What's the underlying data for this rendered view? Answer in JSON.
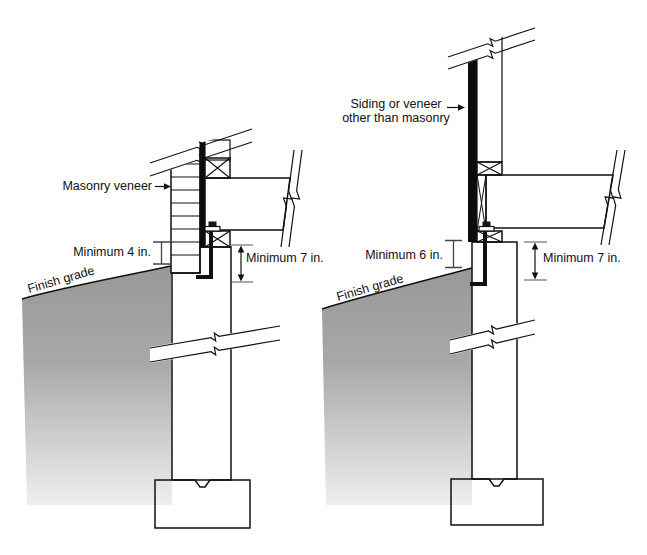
{
  "figure": {
    "title_hint": "Foundation clearance details for exterior wall finishes",
    "left_diagram": {
      "veneer_label": "Masonry veneer",
      "min_clearance_label": "Minimum 4 in.",
      "embedment_label": "Minimum 7 in.",
      "grade_label": "Finish grade"
    },
    "right_diagram": {
      "siding_label_line1": "Siding or veneer",
      "siding_label_line2": "other than masonry",
      "min_clearance_label": "Minimum 6 in.",
      "embedment_label": "Minimum 7 in.",
      "grade_label": "Finish grade"
    },
    "colors": {
      "framing_gray": "#ababab",
      "brick_fill": "#d6d6d6",
      "concrete_fill": "#e4e4e4",
      "siding_black": "#0d0d0d",
      "grade_top": "#989898",
      "grade_mid": "#a8a8a8",
      "grade_bottom": "#efefef",
      "line_black": "#111111",
      "text_color": "#111111",
      "background": "#ffffff"
    }
  }
}
